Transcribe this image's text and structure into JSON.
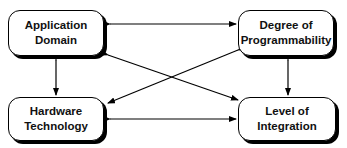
{
  "diagram": {
    "nodes": [
      {
        "id": "application-domain",
        "line1": "Application",
        "line2": "Domain"
      },
      {
        "id": "degree-of-programmability",
        "line1": "Degree of",
        "line2": "Programmability"
      },
      {
        "id": "hardware-technology",
        "line1": "Hardware",
        "line2": "Technology"
      },
      {
        "id": "level-of-integration",
        "line1": "Level of",
        "line2": "Integration"
      }
    ],
    "edges": [
      {
        "from": "application-domain",
        "to": "degree-of-programmability",
        "type": "bidirectional"
      },
      {
        "from": "application-domain",
        "to": "hardware-technology",
        "type": "bidirectional"
      },
      {
        "from": "application-domain",
        "to": "level-of-integration",
        "type": "bidirectional"
      },
      {
        "from": "degree-of-programmability",
        "to": "hardware-technology",
        "type": "bidirectional"
      },
      {
        "from": "degree-of-programmability",
        "to": "level-of-integration",
        "type": "bidirectional"
      },
      {
        "from": "hardware-technology",
        "to": "level-of-integration",
        "type": "bidirectional"
      }
    ]
  }
}
